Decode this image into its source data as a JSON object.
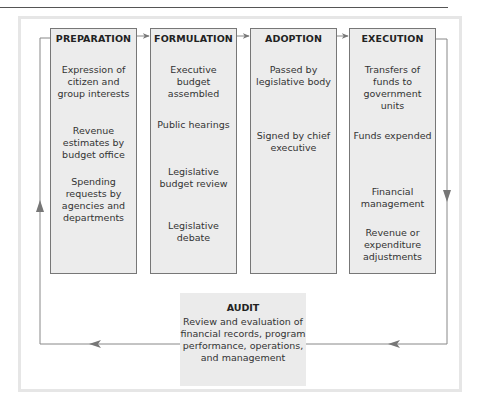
{
  "page": {
    "cropped_heading": "p    Budget"
  },
  "stages": [
    {
      "title": "PREPARATION",
      "items": [
        "Expression of citizen and group interests",
        "Revenue estimates by budget office",
        "Spending requests by agencies and departments"
      ]
    },
    {
      "title": "FORMULATION",
      "items": [
        "Executive budget assembled",
        "Public hearings",
        "Legislative budget review",
        "Legislative debate"
      ]
    },
    {
      "title": "ADOPTION",
      "items": [
        "Passed by legislative body",
        "Signed by chief executive"
      ]
    },
    {
      "title": "EXECUTION",
      "items": [
        "Transfers of funds to government units",
        "Funds expended",
        "Financial management",
        "Revenue or expenditure adjustments"
      ]
    }
  ],
  "audit": {
    "title": "AUDIT",
    "description": "Review and evaluation of financial records, program performance, operations, and management"
  },
  "flow": [
    "PREPARATION",
    "FORMULATION",
    "ADOPTION",
    "EXECUTION",
    "AUDIT",
    "PREPARATION"
  ],
  "colors": {
    "box_fill": "#ececec",
    "box_border": "#777777",
    "line": "#888888",
    "frame": "#e6e6e6"
  }
}
